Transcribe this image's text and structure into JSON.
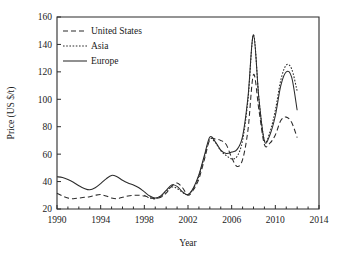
{
  "chart_data": {
    "type": "line",
    "title": "",
    "xlabel": "Year",
    "ylabel": "Price (US $/t)",
    "xlim": [
      1990,
      2014
    ],
    "ylim": [
      20,
      160
    ],
    "xticks": [
      1990,
      1994,
      1998,
      2002,
      2006,
      2010,
      2014
    ],
    "yticks": [
      20,
      40,
      60,
      80,
      100,
      120,
      140,
      160
    ],
    "xtick_labels": [
      "1990",
      "1994",
      "1998",
      "2002",
      "2006",
      "2010",
      "2014"
    ],
    "ytick_labels": [
      "20",
      "40",
      "60",
      "80",
      "100",
      "120",
      "140",
      "160"
    ],
    "grid": false,
    "legend_position": "top-left",
    "x": [
      1990.0,
      1990.5,
      1991.0,
      1991.5,
      1992.0,
      1992.5,
      1993.0,
      1993.5,
      1994.0,
      1994.5,
      1995.0,
      1995.5,
      1996.0,
      1996.5,
      1997.0,
      1997.5,
      1998.0,
      1998.5,
      1999.0,
      1999.5,
      2000.0,
      2000.5,
      2001.0,
      2001.5,
      2002.0,
      2002.5,
      2003.0,
      2003.5,
      2004.0,
      2004.5,
      2005.0,
      2005.5,
      2006.0,
      2006.5,
      2007.0,
      2007.5,
      2008.0,
      2008.5,
      2009.0,
      2009.5,
      2010.0,
      2010.5,
      2011.0,
      2011.5,
      2012.0
    ],
    "series": [
      {
        "name": "United States",
        "style": "dashed",
        "color": "#2b2b2b",
        "values": [
          31.5,
          29.5,
          28.0,
          27.5,
          28.0,
          28.5,
          29.0,
          30.0,
          30.5,
          29.5,
          28.0,
          27.5,
          28.5,
          29.5,
          30.0,
          30.0,
          29.5,
          28.5,
          27.5,
          28.5,
          31.5,
          36.5,
          39.0,
          35.5,
          30.0,
          34.0,
          42.0,
          56.0,
          70.5,
          71.0,
          70.0,
          67.0,
          57.5,
          51.0,
          56.0,
          78.0,
          118.0,
          92.0,
          67.0,
          68.0,
          74.0,
          84.5,
          87.0,
          83.0,
          72.0
        ]
      },
      {
        "name": "Asia",
        "style": "dotted",
        "color": "#2b2b2b",
        "values": [
          null,
          null,
          null,
          null,
          null,
          null,
          null,
          null,
          null,
          null,
          null,
          null,
          null,
          null,
          null,
          null,
          30.0,
          28.0,
          27.5,
          29.0,
          33.0,
          36.0,
          35.0,
          32.0,
          30.5,
          35.0,
          44.0,
          58.0,
          71.0,
          68.5,
          62.5,
          59.0,
          56.5,
          58.5,
          70.0,
          100.0,
          147.0,
          100.0,
          70.0,
          76.0,
          92.0,
          114.0,
          125.0,
          122.0,
          106.0
        ]
      },
      {
        "name": "Europe",
        "style": "solid",
        "color": "#2b2b2b",
        "values": [
          43.5,
          43.0,
          41.5,
          39.5,
          37.0,
          35.0,
          34.0,
          35.5,
          38.5,
          42.0,
          44.5,
          43.5,
          41.0,
          39.0,
          37.5,
          35.5,
          32.5,
          29.5,
          28.0,
          29.5,
          33.5,
          37.5,
          36.5,
          32.5,
          30.5,
          35.5,
          45.0,
          59.0,
          72.5,
          69.0,
          63.0,
          60.5,
          61.5,
          63.5,
          73.0,
          102.0,
          147.0,
          100.0,
          69.5,
          74.0,
          88.0,
          110.0,
          120.0,
          116.0,
          92.0
        ]
      }
    ],
    "annotations": {
      "peak_2008": 147,
      "peak_2008_us": 118,
      "peak_2011_asia": 125,
      "peak_2011_europe": 120,
      "peak_2011_us": 87
    }
  },
  "legend": {
    "items": [
      {
        "label": "United States",
        "style": "dashed"
      },
      {
        "label": "Asia",
        "style": "dotted"
      },
      {
        "label": "Europe",
        "style": "solid"
      }
    ]
  }
}
